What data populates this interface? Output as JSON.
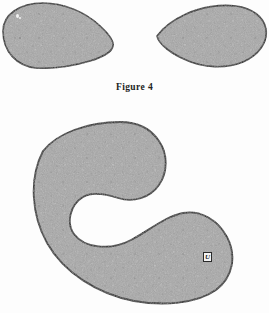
{
  "figure": {
    "caption": "Figure 4",
    "background_color": "#fdfdfd",
    "outline_color": "#1e1e1e",
    "fill_color": "#a8a8a8",
    "fill_color_light": "#b4b4b4",
    "fill_color_dark": "#9a9a9a"
  },
  "labels": {
    "u_label": "U"
  },
  "shapes": {
    "top_left_blob": {
      "name": "teardrop-blob-left",
      "description": "rounded blob, broad at left, tapering to a blunt point at right",
      "path": "M 3 30 C 3 14, 20 3, 44 3 C 68 3, 92 16, 106 32 C 113 41, 113 48, 104 55 C 92 64, 66 68, 42 68 C 18 68, 3 54, 3 30 Z",
      "bbox": [
        2,
        2,
        114,
        69
      ]
    },
    "top_right_blob": {
      "name": "teardrop-blob-right",
      "description": "mirrored blob, tapering to a point at left, broad rounded at right, clipped by page edge",
      "path": "M 157 35 C 168 22, 190 9, 214 7 C 238 5, 258 12, 264 26 C 270 40, 262 56, 243 63 C 222 71, 196 66, 176 56 C 163 49, 153 42, 157 35 Z",
      "bbox": [
        156,
        5,
        269,
        72
      ]
    },
    "crescent": {
      "name": "crescent-c-shape",
      "description": "large C / crescent shape, opening faces right, thick rounded arms",
      "outer_path": "M 147 134 C 170 148, 176 172, 163 190 C 151 207, 128 210, 113 200 C 97 190, 80 186, 68 196 C 54 208, 55 228, 70 240 C 88 254, 120 254, 144 238 C 168 222, 192 213, 210 226 C 228 239, 231 264, 214 281 C 193 301, 150 305, 115 298 C 72 289, 43 262, 36 224 C 28 180, 46 145, 78 131 C 104 120, 130 124, 147 134 Z",
      "bbox": [
        28,
        120,
        232,
        302
      ],
      "notch_center": [
        112,
        222
      ]
    }
  }
}
